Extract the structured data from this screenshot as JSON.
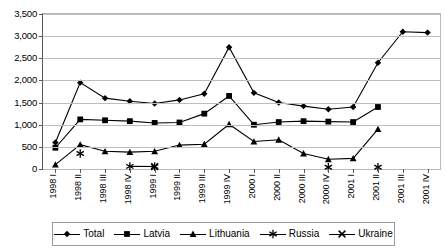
{
  "chart_data": {
    "type": "line",
    "title": "",
    "subtitle": "",
    "xlabel": "",
    "ylabel": "",
    "ylim": [
      0,
      3500
    ],
    "ytick_step": 500,
    "ytick_labels": [
      "0",
      "500",
      "1,000",
      "1,500",
      "2,000",
      "2,500",
      "3,000",
      "3,500"
    ],
    "grid": true,
    "legend_position": "bottom",
    "categories": [
      "1998 I",
      "1998 II",
      "1998 III",
      "1998 IV",
      "1999 I",
      "1999 II",
      "1999 III",
      "1999 IV",
      "2000 I",
      "2000 II",
      "2000 III",
      "2000 IV",
      "2001 I",
      "2001 II",
      "2001 III",
      "2001 IV"
    ],
    "series": [
      {
        "name": "Total",
        "marker": "diamond",
        "color": "#000000",
        "values": [
          600,
          1950,
          1600,
          1530,
          1480,
          1560,
          1700,
          2750,
          1720,
          1500,
          1420,
          1350,
          1400,
          2400,
          3100,
          3080
        ]
      },
      {
        "name": "Latvia",
        "marker": "square",
        "color": "#000000",
        "values": [
          480,
          1120,
          1100,
          1080,
          1040,
          1050,
          1250,
          1650,
          1000,
          1060,
          1080,
          1070,
          1060,
          1400,
          null,
          null
        ]
      },
      {
        "name": "Lithuania",
        "marker": "triangle",
        "color": "#000000",
        "values": [
          100,
          550,
          400,
          380,
          400,
          540,
          560,
          1010,
          620,
          660,
          350,
          220,
          240,
          900,
          null,
          null
        ]
      },
      {
        "name": "Russia",
        "marker": "asterisk",
        "color": "#000000",
        "values": [
          null,
          350,
          null,
          60,
          55,
          null,
          null,
          null,
          null,
          null,
          null,
          40,
          null,
          40,
          null,
          null
        ]
      },
      {
        "name": "Ukraine",
        "marker": "cross",
        "color": "#000000",
        "values": [
          null,
          null,
          null,
          null,
          55,
          null,
          null,
          null,
          null,
          null,
          null,
          null,
          null,
          null,
          null,
          null
        ]
      }
    ]
  },
  "legend": {
    "items": [
      {
        "label": "Total",
        "marker": "diamond"
      },
      {
        "label": "Latvia",
        "marker": "square"
      },
      {
        "label": "Lithuania",
        "marker": "triangle"
      },
      {
        "label": "Russia",
        "marker": "asterisk"
      },
      {
        "label": "Ukraine",
        "marker": "cross"
      }
    ]
  }
}
